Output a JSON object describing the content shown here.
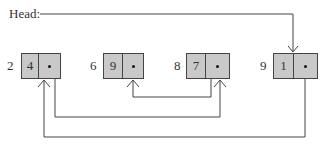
{
  "diagram": {
    "type": "linked-list",
    "head_label": "Head:",
    "head_points_to": "9",
    "nodes": [
      {
        "address": "2",
        "value": "4",
        "next": "8"
      },
      {
        "address": "6",
        "value": "9",
        "next": null
      },
      {
        "address": "8",
        "value": "7",
        "next": "6"
      },
      {
        "address": "9",
        "value": "1",
        "next": "2"
      }
    ],
    "next_marker": "•",
    "colors": {
      "node_fill": "#c9c9c9",
      "line": "#444444"
    }
  }
}
